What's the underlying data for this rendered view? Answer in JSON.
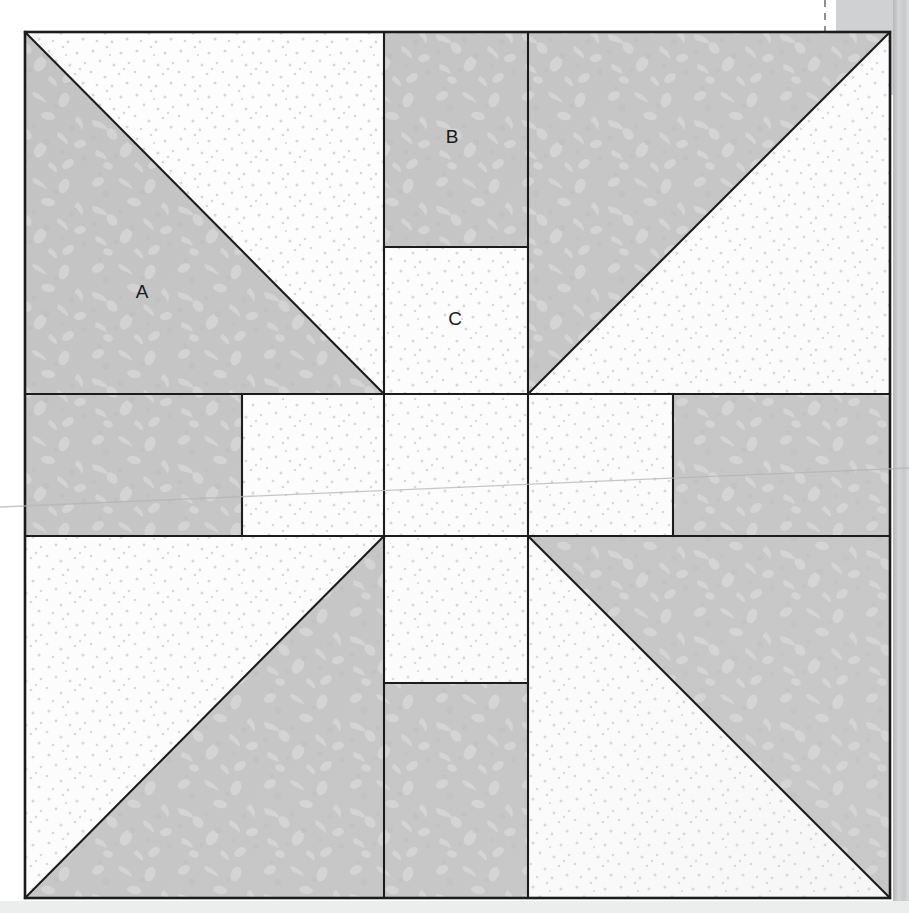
{
  "diagram": {
    "kind": "quilt-block-piecing-diagram",
    "block": {
      "x": 25,
      "y": 32,
      "width": 865,
      "height": 866,
      "outline_color": "#1c1c1c",
      "outline_width": 2.2
    },
    "grid": {
      "vertical": [
        25,
        242,
        384,
        528,
        673,
        890
      ],
      "horizontal": [
        32,
        394,
        536,
        898
      ]
    },
    "fabrics": {
      "print": {
        "name": "gray-print",
        "base": "#c3c3c3",
        "motif": "#d2d2d2",
        "shade": "#b7b7b7"
      },
      "background": {
        "name": "white-dot",
        "base": "#fdfdfd",
        "dot": "#d6d6de"
      }
    },
    "labels": [
      {
        "id": "A",
        "text": "A",
        "x": 142,
        "y": 293
      },
      {
        "id": "B",
        "text": "B",
        "x": 452,
        "y": 138
      },
      {
        "id": "C",
        "text": "C",
        "x": 455,
        "y": 320
      }
    ],
    "pieces": [
      {
        "name": "top-left-hst-print",
        "fabric": "print",
        "shape": "triangle",
        "points": "25,32 25,394 384,394"
      },
      {
        "name": "top-left-hst-background",
        "fabric": "background",
        "shape": "triangle",
        "points": "25,32 384,394 384,32"
      },
      {
        "name": "top-center-rect-print-B",
        "fabric": "print",
        "shape": "rect",
        "points": "384,32 528,32 528,247 384,247"
      },
      {
        "name": "top-center-rect-bg-C",
        "fabric": "background",
        "shape": "rect",
        "points": "384,247 528,247 528,394 384,394"
      },
      {
        "name": "top-right-hst-print",
        "fabric": "print",
        "shape": "triangle",
        "points": "528,32 890,32 528,394"
      },
      {
        "name": "top-right-hst-background",
        "fabric": "background",
        "shape": "triangle",
        "points": "890,32 890,394 528,394"
      },
      {
        "name": "mid-left-rect-print",
        "fabric": "print",
        "shape": "rect",
        "points": "25,394 242,394 242,536 25,536"
      },
      {
        "name": "mid-left-rect-bg",
        "fabric": "background",
        "shape": "rect",
        "points": "242,394 384,394 384,536 242,536"
      },
      {
        "name": "center-square-bg",
        "fabric": "background",
        "shape": "rect",
        "points": "384,394 528,394 528,536 384,536"
      },
      {
        "name": "mid-right-rect-bg",
        "fabric": "background",
        "shape": "rect",
        "points": "528,394 673,394 673,536 528,536"
      },
      {
        "name": "mid-right-rect-print",
        "fabric": "print",
        "shape": "rect",
        "points": "673,394 890,394 890,536 673,536"
      },
      {
        "name": "bottom-left-hst-bg",
        "fabric": "background",
        "shape": "triangle",
        "points": "25,536 384,536 25,898"
      },
      {
        "name": "bottom-left-hst-print",
        "fabric": "print",
        "shape": "triangle",
        "points": "384,536 384,898 25,898"
      },
      {
        "name": "bottom-center-rect-bg",
        "fabric": "background",
        "shape": "rect",
        "points": "384,536 528,536 528,683 384,683"
      },
      {
        "name": "bottom-center-rect-print",
        "fabric": "print",
        "shape": "rect",
        "points": "384,683 528,683 528,898 384,898"
      },
      {
        "name": "bottom-right-hst-print",
        "fabric": "print",
        "shape": "triangle",
        "points": "528,536 890,536 890,898"
      },
      {
        "name": "bottom-right-hst-bg",
        "fabric": "background",
        "shape": "triangle",
        "points": "528,536 890,898 528,898"
      }
    ],
    "seam_lines": [
      {
        "name": "seam-top-left-diagonal",
        "x1": 25,
        "y1": 32,
        "x2": 384,
        "y2": 394
      },
      {
        "name": "seam-top-right-diagonal",
        "x1": 890,
        "y1": 32,
        "x2": 528,
        "y2": 394
      },
      {
        "name": "seam-bottom-left-diagonal",
        "x1": 25,
        "y1": 898,
        "x2": 384,
        "y2": 536
      },
      {
        "name": "seam-bottom-right-diagonal",
        "x1": 890,
        "y1": 898,
        "x2": 528,
        "y2": 536
      },
      {
        "name": "seam-vertical-384-top",
        "x1": 384,
        "y1": 32,
        "x2": 384,
        "y2": 394
      },
      {
        "name": "seam-vertical-528-top",
        "x1": 528,
        "y1": 32,
        "x2": 528,
        "y2": 394
      },
      {
        "name": "seam-horizontal-bc",
        "x1": 384,
        "y1": 247,
        "x2": 528,
        "y2": 247
      },
      {
        "name": "seam-horizontal-394",
        "x1": 25,
        "y1": 394,
        "x2": 890,
        "y2": 394
      },
      {
        "name": "seam-horizontal-536",
        "x1": 25,
        "y1": 536,
        "x2": 890,
        "y2": 536
      },
      {
        "name": "seam-vertical-242-mid",
        "x1": 242,
        "y1": 394,
        "x2": 242,
        "y2": 536
      },
      {
        "name": "seam-vertical-384-mid",
        "x1": 384,
        "y1": 394,
        "x2": 384,
        "y2": 536
      },
      {
        "name": "seam-vertical-528-mid",
        "x1": 528,
        "y1": 394,
        "x2": 528,
        "y2": 536
      },
      {
        "name": "seam-vertical-673-mid",
        "x1": 673,
        "y1": 394,
        "x2": 673,
        "y2": 536
      },
      {
        "name": "seam-vertical-384-bottom",
        "x1": 384,
        "y1": 536,
        "x2": 384,
        "y2": 898
      },
      {
        "name": "seam-vertical-528-bottom",
        "x1": 528,
        "y1": 536,
        "x2": 528,
        "y2": 898
      },
      {
        "name": "seam-horizontal-bottom-split",
        "x1": 384,
        "y1": 683,
        "x2": 528,
        "y2": 683
      }
    ],
    "scan_artifacts": {
      "page_edge_right": {
        "x": 893,
        "width": 16,
        "color": "#c9cbcc"
      },
      "page_edge_strip": {
        "x": 836,
        "y": 0,
        "width": 73,
        "height": 95,
        "color": "#cfd1d2"
      },
      "registration_dash_top": {
        "x": 825,
        "y": 0,
        "height": 88,
        "color": "#8e9091"
      },
      "registration_dash_bottom": {
        "x": 828,
        "y": 880,
        "height": 26,
        "color": "#8e9091"
      },
      "fold_line": {
        "x1": 0,
        "y1": 505,
        "x2": 909,
        "y2": 470,
        "color": "#b9b9b9"
      },
      "bottom_shadow": {
        "y": 900,
        "height": 13,
        "color": "#e8e9ea"
      }
    }
  }
}
